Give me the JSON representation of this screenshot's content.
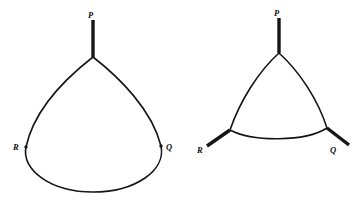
{
  "figure": {
    "background_color": "#ffffff",
    "stroke_color": "#161616",
    "panels": [
      {
        "name": "left-panel",
        "shape_type": "teardrop-convex-curve",
        "description": "Closed convex curve with a single cusp at vertex P and smooth points R and Q",
        "cusp_count": 1,
        "vertices": [
          {
            "label": "P",
            "x": 93,
            "y": 57,
            "label_x": 88,
            "label_y": 11,
            "has_ray": true,
            "ray_end_x": 93,
            "ray_end_y": 20
          },
          {
            "label": "Q",
            "x": 161,
            "y": 146,
            "label_x": 166,
            "label_y": 143,
            "has_ray": false
          },
          {
            "label": "R",
            "x": 26,
            "y": 147,
            "label_x": 13,
            "label_y": 143,
            "has_ray": false
          }
        ],
        "outline_path": "M 93 57 C 120 78 152 110 161 146 C 166 170 136 192 93 192 C 51 192 21 170 26 147 C 34 110 66 78 93 57 Z"
      },
      {
        "name": "right-panel",
        "shape_type": "reuleaux-triangle-curve",
        "description": "Closed curve with three cusps at P, Q and R, each cusp emitting a straight ray outward",
        "cusp_count": 3,
        "vertices": [
          {
            "label": "P",
            "x": 279,
            "y": 53,
            "label_x": 274,
            "label_y": 9,
            "has_ray": true,
            "ray_end_x": 279,
            "ray_end_y": 18
          },
          {
            "label": "Q",
            "x": 327,
            "y": 128,
            "label_x": 330,
            "label_y": 146,
            "has_ray": true,
            "ray_end_x": 349,
            "ray_end_y": 145
          },
          {
            "label": "R",
            "x": 230,
            "y": 130,
            "label_x": 197,
            "label_y": 146,
            "has_ray": true,
            "ray_end_x": 207,
            "ray_end_y": 146
          }
        ],
        "outline_path": "M 279 53 C 300 72 318 100 327 128 C 305 142 253 142 230 130 C 240 101 258 72 279 53 Z"
      }
    ]
  }
}
